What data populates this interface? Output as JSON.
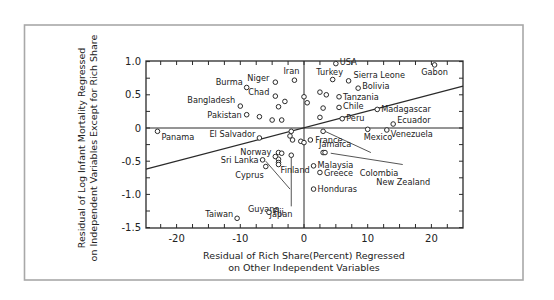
{
  "chart_data": {
    "type": "scatter",
    "title": "",
    "xlabel": "Residual of Rich Share (Percent) Regressed on Other Independent Variables",
    "xlabel_lines": [
      "Residual of Rich Share(Percent) Regressed",
      "on Other Independent Variables"
    ],
    "ylabel": "Residual of Log Infant Mortality Regressed on Independent Variables Except for Rich Share",
    "ylabel_lines": [
      "Residual of Log Infant Mortality Regressed",
      "on Independent Variables Except for Rich Share"
    ],
    "xlim": [
      -25,
      25
    ],
    "ylim": [
      -1.5,
      1.05
    ],
    "x_ticks": [
      -20,
      -10,
      0,
      10,
      20
    ],
    "x_tick_labels": [
      "-20",
      "-10",
      "0",
      "10",
      "20"
    ],
    "y_ticks": [
      1.0,
      0.5,
      0,
      -0.5,
      -1.0,
      -1.5
    ],
    "y_tick_labels": [
      "1.0",
      "0.5",
      "0",
      "-0.5",
      "-1.0",
      "-1.5"
    ],
    "grid": false,
    "reference_lines": {
      "x": 0,
      "y": 0
    },
    "regression_line": {
      "x": [
        -25,
        25
      ],
      "y": [
        -0.62,
        0.63
      ]
    },
    "labeled_points": [
      {
        "label": "USA",
        "x": 5,
        "y": 0.97
      },
      {
        "label": "Gabon",
        "x": 20.5,
        "y": 0.95
      },
      {
        "label": "Turkey",
        "x": 4.5,
        "y": 0.73
      },
      {
        "label": "Sierra Leone",
        "x": 7,
        "y": 0.71
      },
      {
        "label": "Iran",
        "x": -1.5,
        "y": 0.72
      },
      {
        "label": "Niger",
        "x": -4.5,
        "y": 0.69
      },
      {
        "label": "Burma",
        "x": -9,
        "y": 0.61
      },
      {
        "label": "Bolivia",
        "x": 8.5,
        "y": 0.6
      },
      {
        "label": "Chad",
        "x": -4.5,
        "y": 0.48
      },
      {
        "label": "Tanzania",
        "x": 5.5,
        "y": 0.47
      },
      {
        "label": "Bangladesh",
        "x": -10,
        "y": 0.33
      },
      {
        "label": "Chile",
        "x": 5.5,
        "y": 0.31
      },
      {
        "label": "Madagascar",
        "x": 11.5,
        "y": 0.28
      },
      {
        "label": "Pakistan",
        "x": -9,
        "y": 0.2
      },
      {
        "label": "Peru",
        "x": 6,
        "y": 0.14
      },
      {
        "label": "Ecuador",
        "x": 14,
        "y": 0.06
      },
      {
        "label": "Panama",
        "x": -23,
        "y": -0.05
      },
      {
        "label": "Mexico",
        "x": 10,
        "y": -0.02
      },
      {
        "label": "Venezuela",
        "x": 13,
        "y": -0.03
      },
      {
        "label": "El Salvador",
        "x": -7,
        "y": -0.15
      },
      {
        "label": "France",
        "x": 1,
        "y": -0.18
      },
      {
        "label": "Colombia",
        "x": 5.5,
        "y": -0.03
      },
      {
        "label": "Jamaica",
        "x": 3,
        "y": -0.37
      },
      {
        "label": "New Zealand",
        "x": 3.8,
        "y": -0.35
      },
      {
        "label": "Norway",
        "x": -4.5,
        "y": -0.43
      },
      {
        "label": "Sri Lanka",
        "x": -6.5,
        "y": -0.48
      },
      {
        "label": "Cyprus",
        "x": -6,
        "y": -0.58
      },
      {
        "label": "Finland",
        "x": -4,
        "y": -0.55
      },
      {
        "label": "Malaysia",
        "x": 1.5,
        "y": -0.57
      },
      {
        "label": "Greece",
        "x": 2.5,
        "y": -0.67
      },
      {
        "label": "Guyana",
        "x": -6,
        "y": -0.48
      },
      {
        "label": "Japan",
        "x": -1.5,
        "y": -0.43
      },
      {
        "label": "Honduras",
        "x": 1.5,
        "y": -0.92
      },
      {
        "label": "Fiji",
        "x": -5.5,
        "y": -1.27
      },
      {
        "label": "Taiwan",
        "x": -10.5,
        "y": -1.36
      }
    ],
    "unlabeled_points": [
      {
        "x": 0,
        "y": 0.47
      },
      {
        "x": 0.5,
        "y": 0.38
      },
      {
        "x": 2.5,
        "y": 0.54
      },
      {
        "x": 3.5,
        "y": 0.5
      },
      {
        "x": -3,
        "y": 0.4
      },
      {
        "x": -4,
        "y": 0.32
      },
      {
        "x": 3,
        "y": 0.3
      },
      {
        "x": -7,
        "y": 0.17
      },
      {
        "x": -5,
        "y": 0.12
      },
      {
        "x": -3.5,
        "y": 0.12
      },
      {
        "x": 2.5,
        "y": 0.16
      },
      {
        "x": -2,
        "y": -0.05
      },
      {
        "x": -2.2,
        "y": -0.12
      },
      {
        "x": -1.8,
        "y": -0.18
      },
      {
        "x": -0.5,
        "y": -0.2
      },
      {
        "x": 0,
        "y": -0.22
      },
      {
        "x": 3,
        "y": -0.05
      },
      {
        "x": -4,
        "y": -0.37
      },
      {
        "x": -3.5,
        "y": -0.38
      },
      {
        "x": -4,
        "y": -0.47
      },
      {
        "x": -4,
        "y": -0.52
      },
      {
        "x": -2,
        "y": -0.41
      }
    ]
  }
}
